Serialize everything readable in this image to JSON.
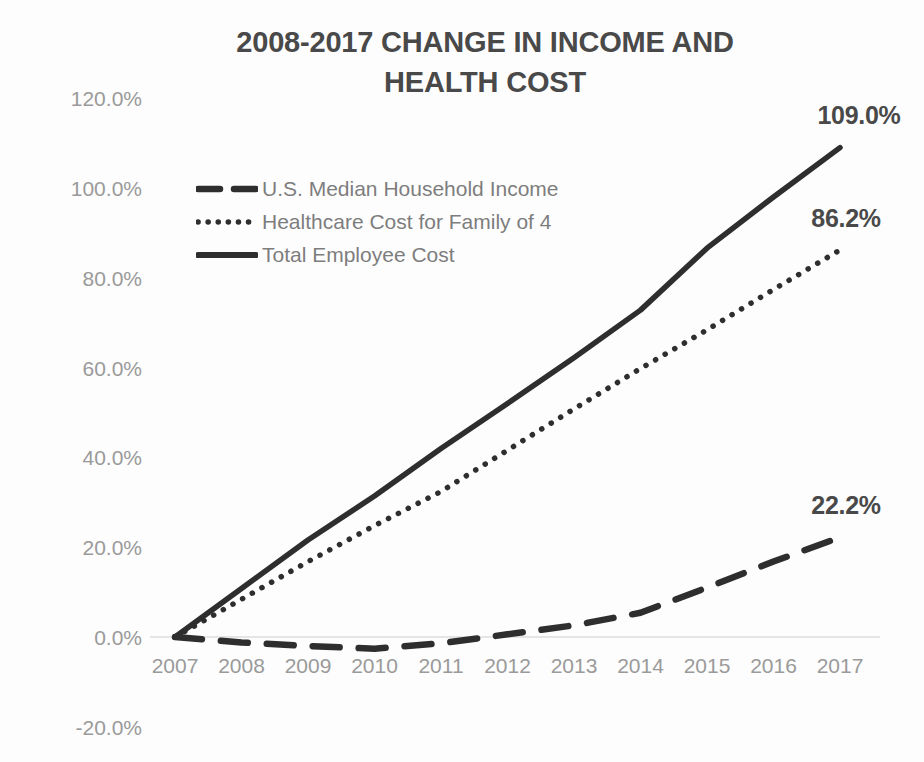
{
  "chart_data": {
    "type": "line",
    "title": "2008-2017 CHANGE IN INCOME AND HEALTH COST",
    "title_line1": "2008-2017 CHANGE IN INCOME AND",
    "title_line2": "HEALTH COST",
    "xlabel": "",
    "ylabel": "",
    "categories": [
      "2007",
      "2008",
      "2009",
      "2010",
      "2011",
      "2012",
      "2013",
      "2014",
      "2015",
      "2016",
      "2017"
    ],
    "ylim": [
      -20,
      120
    ],
    "yticks": [
      "120.0%",
      "100.0%",
      "80.0%",
      "60.0%",
      "40.0%",
      "20.0%",
      "0.0%",
      "-20.0%"
    ],
    "ytick_values": [
      120,
      100,
      80,
      60,
      40,
      20,
      0,
      -20
    ],
    "grid": false,
    "zero_line": true,
    "legend_position": "inside-upper-left",
    "series": [
      {
        "name": "U.S. Median Household Income",
        "style": "dashed",
        "values": [
          0.0,
          -1.2,
          -2.0,
          -2.6,
          -1.4,
          0.6,
          2.6,
          5.4,
          11.0,
          16.8,
          22.2
        ],
        "end_label": "22.2%"
      },
      {
        "name": "Healthcare Cost for Family of 4",
        "style": "dotted",
        "values": [
          0.0,
          8.4,
          16.8,
          24.8,
          32.4,
          41.6,
          50.8,
          59.8,
          68.4,
          77.4,
          86.2
        ],
        "end_label": "86.2%"
      },
      {
        "name": "Total Employee Cost",
        "style": "solid",
        "values": [
          0.0,
          10.8,
          21.6,
          31.4,
          42.0,
          52.0,
          62.2,
          72.8,
          86.6,
          98.0,
          109.0
        ],
        "end_label": "109.0%"
      }
    ],
    "data_labels": [
      {
        "text": "109.0%",
        "x": 859,
        "y": 115
      },
      {
        "text": "86.2%",
        "x": 846,
        "y": 218
      },
      {
        "text": "22.2%",
        "x": 846,
        "y": 505
      }
    ],
    "colors": {
      "line": "#2e2e2e",
      "title": "#494949",
      "tick": "#9a9a9a",
      "legend_text": "#7d7d7d",
      "zero_line": "#dcdcdc",
      "background": "#fdfdfd"
    }
  },
  "legend": {
    "items": [
      {
        "label": "U.S. Median Household Income",
        "style": "dashed"
      },
      {
        "label": "Healthcare Cost for Family of 4",
        "style": "dotted"
      },
      {
        "label": "Total Employee Cost",
        "style": "solid"
      }
    ]
  }
}
